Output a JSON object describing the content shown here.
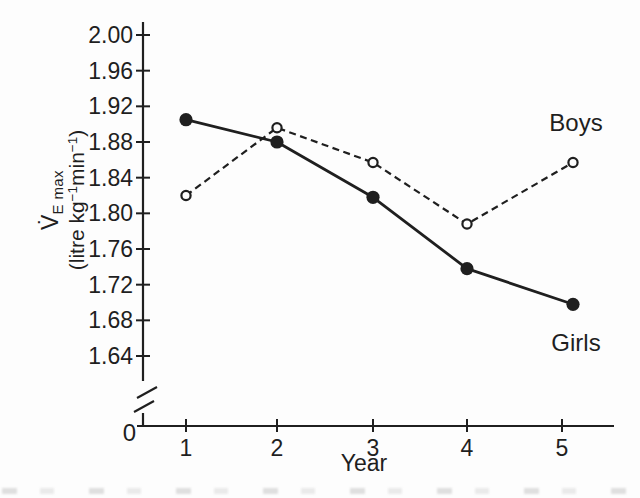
{
  "figure": {
    "x_axis_label": "Year",
    "origin_label": "0",
    "y_axis_label": {
      "symbol": "V̇",
      "subscript": "E max",
      "unit": {
        "pre": "(litre kg",
        "sup1": "−1",
        "mid": "min",
        "sup2": "−1",
        "post": ")"
      }
    }
  },
  "colors": {
    "ink": "#1f1f1f",
    "background": "#fdfdfd",
    "open_marker_fill": "#fdfdfd"
  },
  "chart_data": {
    "type": "line",
    "title": "",
    "xlabel": "Year",
    "ylabel": "V̇E max (litre kg−1 min−1)",
    "x": [
      1,
      2,
      3,
      4,
      5
    ],
    "x_tick_labels": [
      "1",
      "2",
      "3",
      "4",
      "5"
    ],
    "y_tick_values": [
      2.0,
      1.96,
      1.92,
      1.88,
      1.84,
      1.8,
      1.76,
      1.72,
      1.68,
      1.64
    ],
    "y_tick_labels": [
      "2.00",
      "1.96",
      "1.92",
      "1.88",
      "1.84",
      "1.80",
      "1.76",
      "1.72",
      "1.68",
      "1.64"
    ],
    "ylim_display": [
      1.64,
      2.0
    ],
    "axis_break_to_zero": true,
    "origin_label": "0",
    "grid": false,
    "legend_position": "inline-annotations",
    "series": [
      {
        "name": "Boys",
        "line_style": "dashed",
        "marker": "open-circle",
        "values": [
          1.82,
          1.896,
          1.857,
          1.788,
          1.857
        ]
      },
      {
        "name": "Girls",
        "line_style": "solid",
        "marker": "filled-circle",
        "values": [
          1.905,
          1.88,
          1.818,
          1.738,
          1.698
        ]
      }
    ]
  }
}
